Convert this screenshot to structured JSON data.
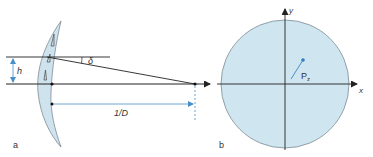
{
  "panel_a": {
    "label": "a",
    "height_label": "h",
    "angle_label": "δ",
    "distance_label": "1/D"
  },
  "panel_b": {
    "label": "b",
    "x_axis_label": "x",
    "y_axis_label": "y",
    "point_label": "P",
    "point_subscript": "z"
  },
  "colors": {
    "lens_fill": "#cfe3ee",
    "pupil_fill": "#cfe6f0",
    "outline": "#7d8a94",
    "line": "#222222",
    "accent_blue": "#4a90c8"
  }
}
